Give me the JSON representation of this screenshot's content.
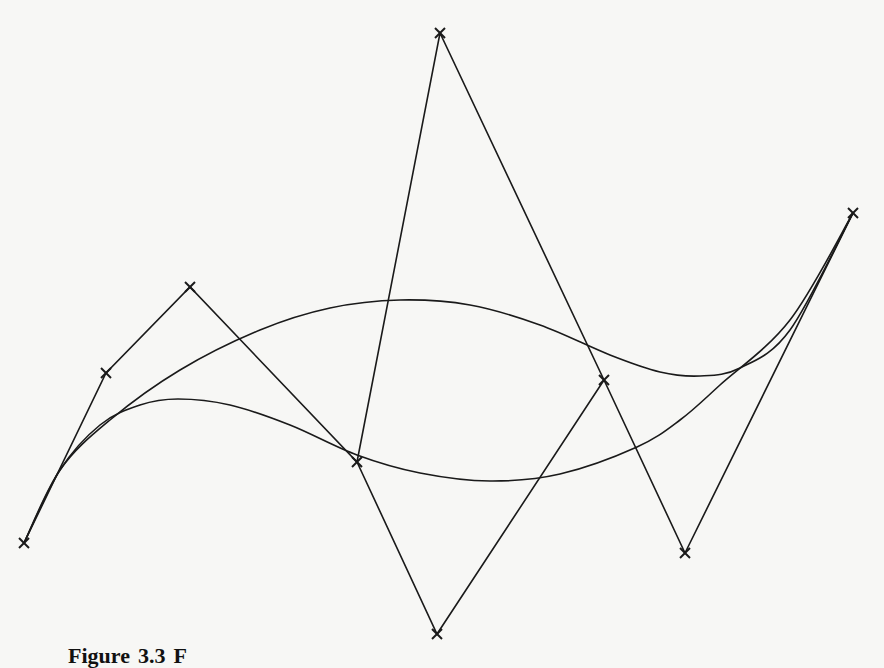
{
  "figure": {
    "caption_label": "Figure",
    "caption_number": "3.3",
    "caption_rest": "F",
    "line_color": "#1a1a1a",
    "background": "#f7f7f5"
  },
  "chart_data": {
    "type": "diagram",
    "title": "",
    "control_polygons": [
      {
        "name": "polygon-a",
        "points": [
          [
            24,
            543
          ],
          [
            106,
            373
          ],
          [
            190,
            287
          ],
          [
            357,
            462
          ],
          [
            440,
            33
          ],
          [
            604,
            380
          ],
          [
            685,
            553
          ],
          [
            853,
            213
          ]
        ]
      },
      {
        "name": "polygon-b",
        "points": [
          [
            357,
            462
          ],
          [
            437,
            634
          ],
          [
            604,
            380
          ]
        ]
      }
    ],
    "control_point_marker": "x",
    "curves": [
      {
        "name": "upper-curve",
        "samples": [
          [
            24,
            543
          ],
          [
            60,
            470
          ],
          [
            110,
            420
          ],
          [
            180,
            370
          ],
          [
            260,
            330
          ],
          [
            330,
            308
          ],
          [
            400,
            300
          ],
          [
            470,
            305
          ],
          [
            540,
            325
          ],
          [
            610,
            355
          ],
          [
            660,
            372
          ],
          [
            700,
            376
          ],
          [
            740,
            368
          ],
          [
            790,
            330
          ],
          [
            853,
            213
          ]
        ]
      },
      {
        "name": "lower-curve",
        "samples": [
          [
            24,
            543
          ],
          [
            60,
            470
          ],
          [
            100,
            425
          ],
          [
            140,
            405
          ],
          [
            178,
            399
          ],
          [
            230,
            405
          ],
          [
            290,
            425
          ],
          [
            357,
            455
          ],
          [
            420,
            473
          ],
          [
            490,
            481
          ],
          [
            560,
            474
          ],
          [
            637,
            447
          ],
          [
            680,
            420
          ],
          [
            720,
            385
          ],
          [
            790,
            320
          ],
          [
            853,
            213
          ]
        ]
      }
    ],
    "grid": false,
    "legend": false
  }
}
